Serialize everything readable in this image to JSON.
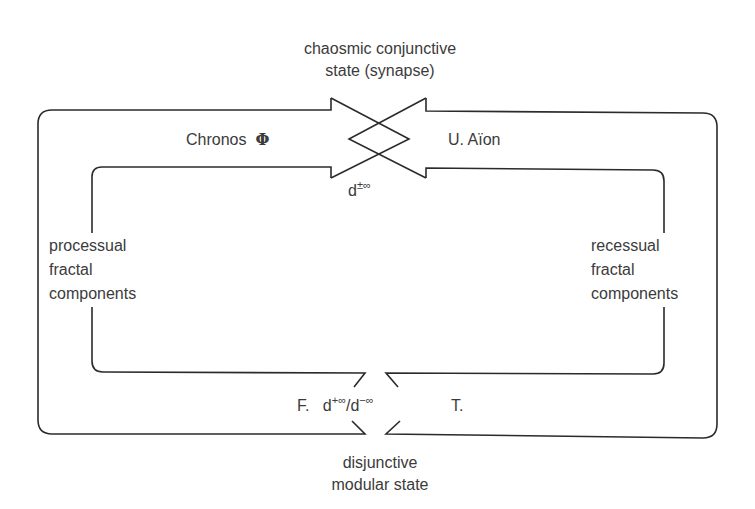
{
  "diagram": {
    "type": "loop-diagram",
    "stroke_color": "#2b2b2b",
    "top_node": {
      "line1": "chaosmic conjunctive",
      "line2": "state (synapse)"
    },
    "bottom_node": {
      "line1": "disjunctive",
      "line2": "modular state"
    },
    "upper_left_label": {
      "text": "Chronos",
      "symbol": "Φ"
    },
    "upper_right_label": {
      "text": "U. Aïon"
    },
    "top_crossing_label": {
      "base": "d",
      "superscript": "±∞"
    },
    "left_side_label": {
      "lines": [
        "processual",
        "fractal",
        "components"
      ]
    },
    "right_side_label": {
      "lines": [
        "recessual",
        "fractal",
        "components"
      ]
    },
    "bottom_gap_label": {
      "left": "F.",
      "base1": "d",
      "sup1": "+∞",
      "separator": "/",
      "base2": "d",
      "sup2": "−∞",
      "right": "T."
    }
  }
}
